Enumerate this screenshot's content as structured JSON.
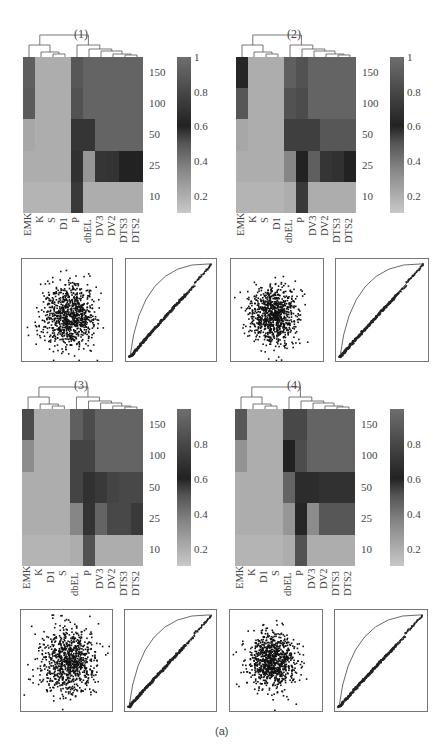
{
  "caption": "(a)",
  "chart_data": [
    {
      "type": "heatmap",
      "title": "(1)",
      "columns": [
        "EMK",
        "K",
        "S",
        "D1",
        "P",
        "dbEL",
        "DV3",
        "DV2",
        "DTS3",
        "DTS2"
      ],
      "rows": [
        "150",
        "100",
        "50",
        "25",
        "10"
      ],
      "colorbar_ticks": [
        "1",
        "0.8",
        "0.6",
        "0.4",
        "0.2"
      ],
      "values": [
        [
          0.92,
          0.18,
          0.18,
          0.18,
          0.88,
          0.95,
          0.95,
          0.95,
          0.95,
          0.95
        ],
        [
          0.9,
          0.18,
          0.18,
          0.18,
          0.85,
          0.95,
          0.95,
          0.95,
          0.95,
          0.95
        ],
        [
          0.2,
          0.18,
          0.18,
          0.18,
          0.7,
          0.7,
          0.95,
          0.95,
          0.95,
          0.95
        ],
        [
          0.18,
          0.18,
          0.18,
          0.18,
          0.68,
          0.25,
          0.7,
          0.55,
          0.6,
          0.6
        ],
        [
          0.16,
          0.16,
          0.16,
          0.16,
          0.72,
          0.18,
          0.18,
          0.18,
          0.18,
          0.18
        ]
      ]
    },
    {
      "type": "heatmap",
      "title": "(2)",
      "columns": [
        "EMK",
        "K",
        "S",
        "D1",
        "dbEL",
        "P",
        "DV3",
        "DV2",
        "DTS3",
        "DTS2"
      ],
      "rows": [
        "150",
        "100",
        "50",
        "25",
        "10"
      ],
      "colorbar_ticks": [
        "1",
        "0.8",
        "0.6",
        "0.4",
        "0.2"
      ],
      "values": [
        [
          0.62,
          0.18,
          0.18,
          0.18,
          0.92,
          0.85,
          0.95,
          0.95,
          0.95,
          0.95
        ],
        [
          0.88,
          0.18,
          0.18,
          0.18,
          0.85,
          0.82,
          0.95,
          0.95,
          0.95,
          0.95
        ],
        [
          0.2,
          0.18,
          0.18,
          0.18,
          0.75,
          0.75,
          0.75,
          0.88,
          0.88,
          0.88
        ],
        [
          0.18,
          0.18,
          0.18,
          0.18,
          0.3,
          0.6,
          0.92,
          0.7,
          0.68,
          0.6
        ],
        [
          0.16,
          0.16,
          0.16,
          0.16,
          0.18,
          0.72,
          0.18,
          0.18,
          0.18,
          0.18
        ]
      ]
    },
    {
      "type": "heatmap",
      "title": "(3)",
      "columns": [
        "EMK",
        "K",
        "D1",
        "S",
        "dbEL",
        "P",
        "DV3",
        "DV2",
        "DTS3",
        "DTS2"
      ],
      "rows": [
        "150",
        "100",
        "50",
        "25",
        "10"
      ],
      "colorbar_ticks": [
        "0.8",
        "0.6",
        "0.4",
        "0.2"
      ],
      "values": [
        [
          0.82,
          0.18,
          0.18,
          0.18,
          0.92,
          0.82,
          0.95,
          0.95,
          0.95,
          0.95
        ],
        [
          0.28,
          0.18,
          0.18,
          0.18,
          0.78,
          0.78,
          0.95,
          0.95,
          0.95,
          0.95
        ],
        [
          0.18,
          0.18,
          0.18,
          0.18,
          0.78,
          0.68,
          0.72,
          0.78,
          0.8,
          0.8
        ],
        [
          0.18,
          0.18,
          0.18,
          0.18,
          0.3,
          0.55,
          0.95,
          0.8,
          0.8,
          0.72
        ],
        [
          0.16,
          0.16,
          0.16,
          0.16,
          0.18,
          0.85,
          0.18,
          0.18,
          0.18,
          0.18
        ]
      ]
    },
    {
      "type": "heatmap",
      "title": "(4)",
      "columns": [
        "EMK",
        "K",
        "D1",
        "S",
        "dbEL",
        "P",
        "DV3",
        "DV2",
        "DTS3",
        "DTS2"
      ],
      "rows": [
        "150",
        "100",
        "50",
        "25",
        "10"
      ],
      "colorbar_ticks": [
        "0.8",
        "0.6",
        "0.4",
        "0.2"
      ],
      "values": [
        [
          0.88,
          0.18,
          0.18,
          0.18,
          0.8,
          0.8,
          0.95,
          0.95,
          0.95,
          0.95
        ],
        [
          0.26,
          0.18,
          0.18,
          0.18,
          0.6,
          0.82,
          0.95,
          0.95,
          0.95,
          0.95
        ],
        [
          0.18,
          0.18,
          0.18,
          0.18,
          0.4,
          0.65,
          0.65,
          0.68,
          0.68,
          0.68
        ],
        [
          0.18,
          0.18,
          0.18,
          0.18,
          0.25,
          0.62,
          0.28,
          0.88,
          0.88,
          0.88
        ],
        [
          0.16,
          0.16,
          0.16,
          0.16,
          0.18,
          0.85,
          0.18,
          0.18,
          0.18,
          0.18
        ]
      ]
    },
    {
      "type": "scatter",
      "title": "",
      "description": "Scatter plots (one per panel) showing a dense central cloud of points with outliers",
      "panels": [
        "(1)",
        "(2)",
        "(3)",
        "(4)"
      ]
    },
    {
      "type": "line",
      "title": "",
      "description": "Curve plots (one per panel): an upper convex arc from bottom-left to top-right and a nearly diagonal empirical curve of points below it",
      "panels": [
        "(1)",
        "(2)",
        "(3)",
        "(4)"
      ]
    }
  ],
  "layout": {
    "panels": [
      {
        "heat": [
          23,
          57,
          120,
          156
        ],
        "cbar": [
          177,
          57,
          14,
          156
        ],
        "scatter": [
          21,
          258,
          90,
          102
        ],
        "curve": [
          125,
          258,
          90,
          102
        ],
        "title_x": 74,
        "title_y": 27
      },
      {
        "heat": [
          236,
          57,
          120,
          156
        ],
        "cbar": [
          390,
          57,
          14,
          156
        ],
        "scatter": [
          230,
          258,
          92,
          102
        ],
        "curve": [
          335,
          258,
          92,
          102
        ],
        "title_x": 287,
        "title_y": 27
      },
      {
        "heat": [
          22,
          409,
          121,
          157
        ],
        "cbar": [
          177,
          409,
          14,
          157
        ],
        "scatter": [
          20,
          609,
          91,
          101
        ],
        "curve": [
          124,
          609,
          91,
          101
        ],
        "title_x": 74,
        "title_y": 378
      },
      {
        "heat": [
          235,
          409,
          120,
          157
        ],
        "cbar": [
          390,
          409,
          14,
          157
        ],
        "scatter": [
          229,
          609,
          92,
          101
        ],
        "curve": [
          334,
          609,
          92,
          101
        ],
        "title_x": 287,
        "title_y": 378
      }
    ]
  }
}
